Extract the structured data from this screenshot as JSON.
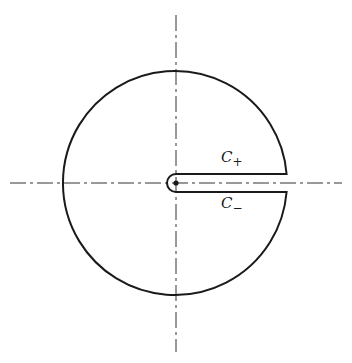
{
  "diagram": {
    "type": "keyhole contour",
    "labels": {
      "upper_contour": {
        "base": "C",
        "subscript": "+"
      },
      "lower_contour": {
        "base": "C",
        "subscript": "−"
      }
    },
    "colors": {
      "stroke": "#1a1a1a",
      "axis": "#333333",
      "background": "#ffffff"
    },
    "geometry": {
      "center": [
        176,
        183
      ],
      "outer_radius": 112,
      "keyhole_radius": 9,
      "slit_half_width": 9,
      "horizontal_axis": [
        10,
        342
      ],
      "vertical_axis": [
        15,
        352
      ]
    }
  }
}
